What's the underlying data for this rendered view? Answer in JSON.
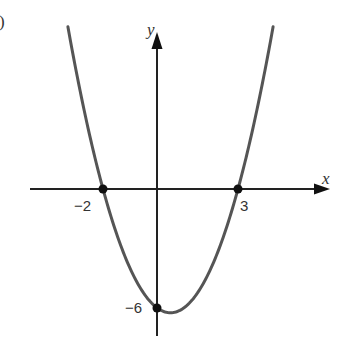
{
  "figure": {
    "part_marker": ")",
    "x_axis_label": "x",
    "y_axis_label": "y",
    "x_intercept_left_label": "−2",
    "x_intercept_right_label": "3",
    "y_intercept_label": "−6"
  },
  "chart_data": {
    "type": "line",
    "title": "",
    "xlabel": "x",
    "ylabel": "y",
    "function": "x^2 - x - 6",
    "marked_points": [
      {
        "x": -2,
        "y": 0,
        "label": "−2"
      },
      {
        "x": 3,
        "y": 0,
        "label": "3"
      },
      {
        "x": 0,
        "y": -6,
        "label": "−6"
      }
    ],
    "vertex": {
      "x": 0.5,
      "y": -6.25
    },
    "xlim": [
      -4.8,
      6.5
    ],
    "ylim": [
      -7.5,
      9
    ],
    "grid": false,
    "colors": {
      "curve": "#555555",
      "axes": "#222222",
      "points": "#111111"
    }
  }
}
